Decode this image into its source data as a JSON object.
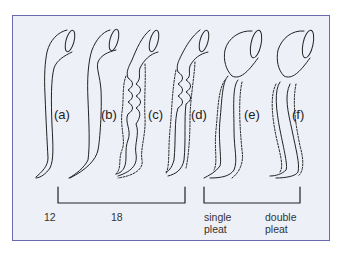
{
  "figure": {
    "panels": [
      {
        "id": "a",
        "label": "(a)",
        "x": 44,
        "y": 100
      },
      {
        "id": "b",
        "label": "(b)",
        "x": 100,
        "y": 100
      },
      {
        "id": "c",
        "label": "(c)",
        "x": 148,
        "y": 100
      },
      {
        "id": "d",
        "label": "(d)",
        "x": 198,
        "y": 100
      },
      {
        "id": "e",
        "label": "(e)",
        "x": 246,
        "y": 100
      },
      {
        "id": "f",
        "label": "(f)",
        "x": 292,
        "y": 100
      }
    ],
    "captions": {
      "c12": "12",
      "c18": "18",
      "single_1": "single",
      "single_2": "pleat",
      "double_1": "double",
      "double_2": "pleat"
    },
    "colors": {
      "frame_border": "#6a6aae",
      "frame_fill": "#eef0f8",
      "line": "#222222"
    }
  }
}
